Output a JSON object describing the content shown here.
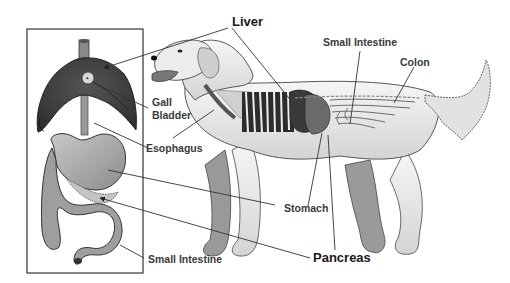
{
  "diagram": {
    "inset_description": "Detached organ view: liver, gall bladder, esophagus, stomach, pancreas, small intestine",
    "labels": {
      "liver": "Liver",
      "gall_bladder_line1": "Gall",
      "gall_bladder_line2": "Bladder",
      "esophagus": "Esophagus",
      "small_intestine_top": "Small Intestine",
      "colon": "Colon",
      "stomach": "Stomach",
      "pancreas": "Pancreas",
      "small_intestine_bottom": "Small Intestine"
    },
    "colors": {
      "liver": "#3d3d3d",
      "organ_light": "#a8a8a8",
      "fur": "#e8e8e8",
      "outline": "#333333",
      "leader": "#444444",
      "label_text": "#2a2a2a"
    }
  }
}
